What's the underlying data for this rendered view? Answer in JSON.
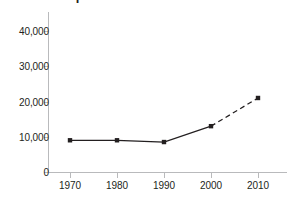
{
  "chart_data": {
    "type": "line",
    "title": "Chinese Population",
    "xlabel": "",
    "ylabel": "",
    "categories": [
      1970,
      1980,
      1990,
      2000,
      2010
    ],
    "x_tick_labels": [
      "1970",
      "1980",
      "1990",
      "2000",
      "2010"
    ],
    "y_tick_labels": [
      "0",
      "10,000",
      "20,000",
      "30,000",
      "40,000"
    ],
    "y_tick_values": [
      0,
      10000,
      20000,
      30000,
      40000
    ],
    "ylim": [
      0,
      44000
    ],
    "xlim": [
      1965,
      2015
    ],
    "grid": false,
    "legend": false,
    "series": [
      {
        "name": "Population",
        "values": [
          9000,
          9000,
          8500,
          13000,
          21000
        ],
        "marker": "square",
        "color": "#231f20",
        "segments": [
          {
            "from": 1970,
            "to": 2000,
            "style": "solid"
          },
          {
            "from": 2000,
            "to": 2010,
            "style": "dashed"
          }
        ]
      }
    ],
    "annotations": [
      {
        "text": "solid line 1970–2000, dashed projection 2000–2010"
      }
    ]
  },
  "axis": {
    "line_color": "#b9babc",
    "tick_color": "#b9babc",
    "text_color": "#231f20"
  }
}
